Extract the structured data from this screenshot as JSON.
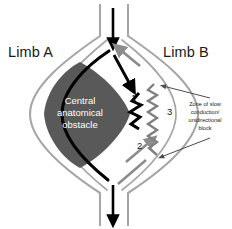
{
  "figure": {
    "background_color": "#ffffff"
  },
  "labels": {
    "limb_a": "Limb A",
    "limb_b": "Limb B",
    "obstacle": "Central\nanatomical\nobstacle",
    "zone": "Zone of slow\nconduction/\nunidirectional\nblock"
  },
  "markers": {
    "one": "1",
    "two": "2",
    "three": "3"
  },
  "colors": {
    "obstacle_fill": "#595959",
    "obstacle_text": "#ffffff",
    "antegrade_path": "#000000",
    "retrograde_path": "#8c8c8c",
    "tissue_outline": "#a6a6a6",
    "block_zigzag": "#000000",
    "slow_zigzag": "#808080",
    "leader_line": "#4d4d4d",
    "text": "#1a1a1a"
  },
  "elements": {
    "inflow_arrow": "downward-black-arrow-top",
    "outflow_arrow": "downward-black-arrow-bottom",
    "retrograde_arrow_top": "upward-gray-arrow",
    "antegrade_arrow_mid": "down-right-black-arrow",
    "retrograde_arrow_mid": "up-right-gray-arrow",
    "black_zigzag": "unidirectional-block-zigzag",
    "gray_zigzag": "slow-conduction-zigzag",
    "leader_upper": "annotation-leader-upper",
    "leader_lower": "annotation-leader-lower"
  }
}
